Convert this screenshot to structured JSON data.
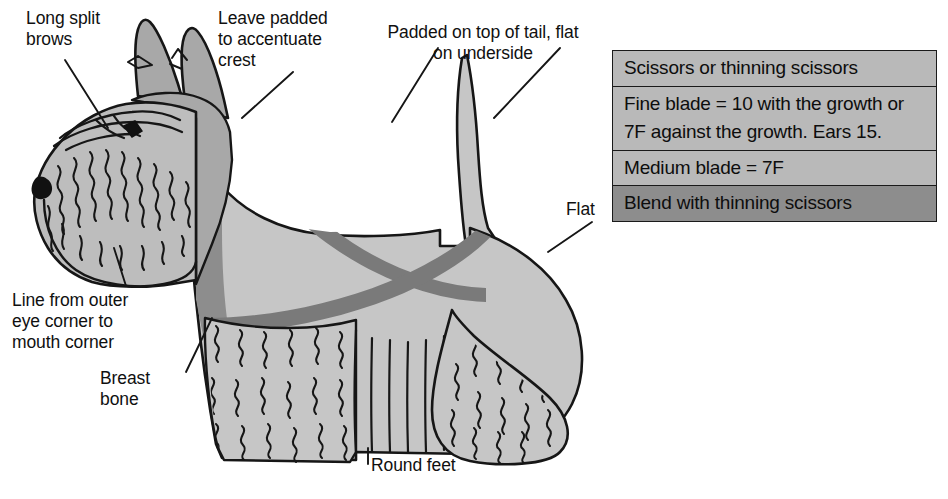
{
  "page": {
    "background_color": "#ffffff"
  },
  "annotations": [
    {
      "id": "long-split-brows",
      "text": "Long split\nbrows"
    },
    {
      "id": "leave-padded",
      "text": "Leave padded\nto accentuate\ncrest"
    },
    {
      "id": "padded-tail",
      "text": "Padded on top of tail, flat\non underside"
    },
    {
      "id": "flat",
      "text": "Flat"
    },
    {
      "id": "eye-corner",
      "text": "Line from outer\neye corner to\nmouth corner"
    },
    {
      "id": "breast-bone",
      "text": "Breast\nbone"
    },
    {
      "id": "round-feet",
      "text": "Round feet"
    }
  ],
  "legend": {
    "rows": [
      {
        "text": "Scissors or thinning scissors",
        "shade": "light"
      },
      {
        "text": "Fine blade = 10 with the growth or 7F against the growth. Ears 15.",
        "shade": "light"
      },
      {
        "text": "Medium blade = 7F",
        "shade": "light"
      },
      {
        "text": "Blend with thinning scissors",
        "shade": "dark"
      }
    ]
  },
  "colors": {
    "body_fill": "#c6c6c6",
    "head_fill": "#bdbdbd",
    "dark_shade": "#8d8d8d",
    "stripe": "#7a7a7a",
    "outline": "#161616",
    "legend_light": "#b9b9b9",
    "legend_dark": "#8d8d8d",
    "text": "#101010"
  },
  "dog": {
    "breed_shape": "scottish-terrier-profile",
    "parts": [
      "ear-left",
      "ear-right",
      "skull-crest",
      "muzzle-beard",
      "eye",
      "nose",
      "neck-stripe",
      "body",
      "body-stripe",
      "tail",
      "front-furnishings",
      "rear-leg",
      "front-foot",
      "rear-foot"
    ]
  }
}
